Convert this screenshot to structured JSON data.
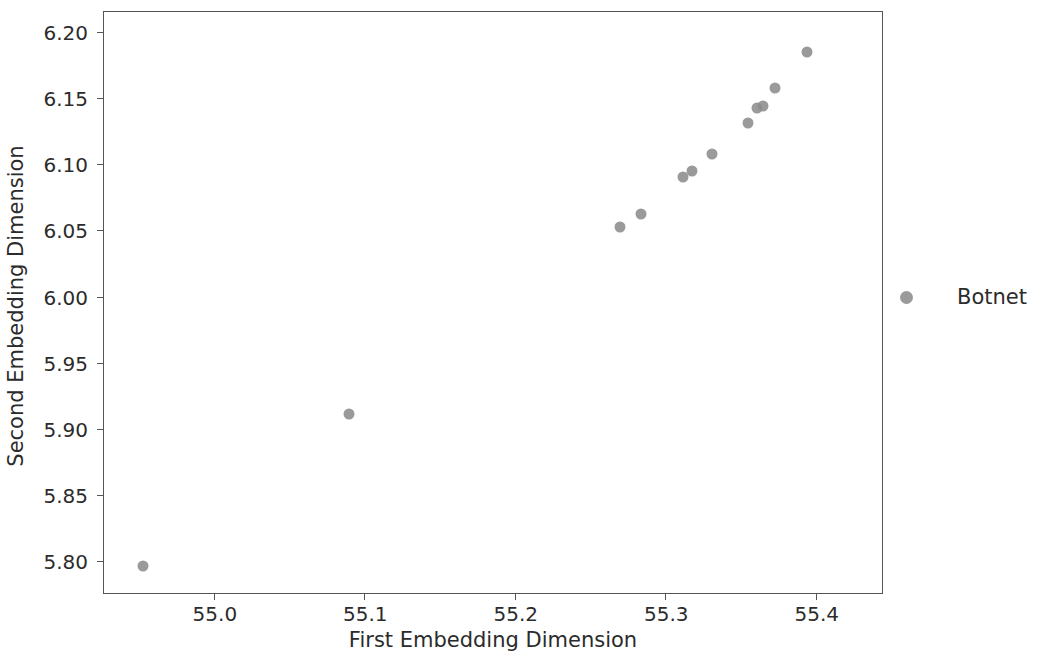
{
  "chart_data": {
    "type": "scatter",
    "title": "",
    "xlabel": "First Embedding Dimension",
    "ylabel": "Second Embedding Dimension",
    "xlim": [
      54.927,
      55.444
    ],
    "ylim": [
      5.776,
      6.215
    ],
    "xticks": [
      55.0,
      55.1,
      55.2,
      55.3,
      55.4
    ],
    "xtick_labels": [
      "55.0",
      "55.1",
      "55.2",
      "55.3",
      "55.4"
    ],
    "yticks": [
      5.8,
      5.85,
      5.9,
      5.95,
      6.0,
      6.05,
      6.1,
      6.15,
      6.2
    ],
    "ytick_labels": [
      "5.80",
      "5.85",
      "5.90",
      "5.95",
      "6.00",
      "6.05",
      "6.10",
      "6.15",
      "6.20"
    ],
    "grid": false,
    "legend_position": "right",
    "marker_color": "#8c8c8c",
    "series": [
      {
        "name": "Botnet",
        "color": "#8c8c8c",
        "points": [
          {
            "x": 54.953,
            "y": 5.7965
          },
          {
            "x": 55.09,
            "y": 5.9115
          },
          {
            "x": 55.27,
            "y": 6.0525
          },
          {
            "x": 55.284,
            "y": 6.062
          },
          {
            "x": 55.312,
            "y": 6.09
          },
          {
            "x": 55.318,
            "y": 6.0945
          },
          {
            "x": 55.331,
            "y": 6.1075
          },
          {
            "x": 55.355,
            "y": 6.131
          },
          {
            "x": 55.361,
            "y": 6.1425
          },
          {
            "x": 55.365,
            "y": 6.144
          },
          {
            "x": 55.373,
            "y": 6.1575
          },
          {
            "x": 55.394,
            "y": 6.1845
          }
        ]
      }
    ]
  },
  "legend": {
    "entries": [
      {
        "label": "Botnet"
      }
    ]
  }
}
